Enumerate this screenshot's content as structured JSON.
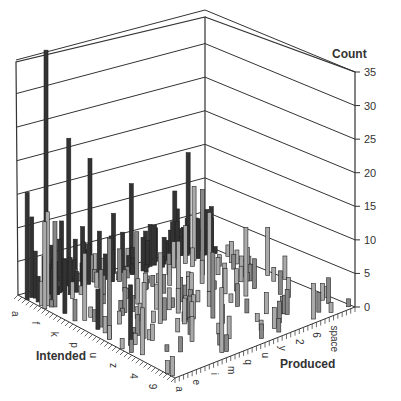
{
  "chart_data": {
    "type": "bar3d",
    "title": "",
    "xlabel": "Produced",
    "ylabel": "Intended",
    "zlabel": "Count",
    "zlim": [
      0,
      35
    ],
    "z_ticks": [
      "0",
      "5",
      "10",
      "15",
      "20",
      "25",
      "30",
      "35"
    ],
    "x_tick_labels": [
      "a",
      "e",
      "i",
      "m",
      "q",
      "u",
      "y",
      "2",
      "6",
      "space"
    ],
    "y_tick_labels": [
      "a",
      "f",
      "k",
      "p",
      "u",
      "z",
      "4",
      "9"
    ],
    "grid": true,
    "legend": null,
    "diagonal_peaks": [
      {
        "label": "a",
        "value": 16
      },
      {
        "label": "e",
        "value": 36
      },
      {
        "label": "i",
        "value": 22
      },
      {
        "label": "m",
        "value": 19
      },
      {
        "label": "q",
        "value": 14
      },
      {
        "label": "u",
        "value": 12
      },
      {
        "label": "y",
        "value": 10
      },
      {
        "label": "space",
        "value": 15
      }
    ]
  },
  "labels": {
    "count": "Count",
    "intended": "Intended",
    "produced": "Produced"
  }
}
